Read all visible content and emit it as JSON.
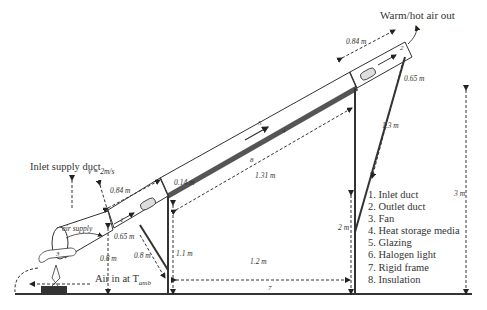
{
  "diagram": {
    "labels": {
      "outlet": "Warm/hot air out",
      "inlet": "Inlet supply duct",
      "velocity": "v = 2m/s",
      "air_supply": "air supply",
      "air_in": "Air in at T",
      "air_in_sub": "amb"
    },
    "dimensions": {
      "outlet_len": "0.84 m",
      "outlet_dia": "0.65 m",
      "inlet_len": "0.84 m",
      "inlet_dia": "0.65 m",
      "collector_len": "1.31 m",
      "collector_thk": "0.14 m",
      "rear_leg": "1.3 m",
      "front_leg": "1.1 m",
      "brace": "0.8 m",
      "base_span": "1.2 m",
      "fan_height": "0.8 m",
      "rear_height": "2 m",
      "total_height": "3 m"
    },
    "part_numbers": {
      "glazing": "5",
      "storage": "4",
      "insulation": "8",
      "frame": "7",
      "fan": "3",
      "inlet": "1",
      "outlet": "2",
      "light": "6"
    },
    "legend": [
      "1. Inlet duct",
      "2. Outlet duct",
      "3. Fan",
      "4. Heat storage media",
      "5. Glazing",
      "6. Halogen light",
      "7. Rigid frame",
      "8. Insulation"
    ]
  }
}
